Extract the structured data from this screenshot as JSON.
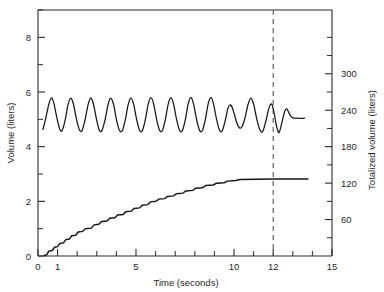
{
  "chart_data": {
    "type": "line",
    "title": "",
    "xlabel": "Time (seconds)",
    "ylabel": "Volume (liters)",
    "y2label": "Totalized volume (liters)",
    "xlim": [
      0,
      15
    ],
    "ylim": [
      0,
      9
    ],
    "y2lim": [
      0,
      405
    ],
    "grid": false,
    "legend": "none",
    "x_ticks_major": [
      0,
      1,
      5,
      10,
      12,
      15
    ],
    "x_tick_labels": [
      "0",
      "1",
      "5",
      "10",
      "12",
      "15"
    ],
    "x_ticks_minor": [
      2,
      3,
      4,
      6,
      7,
      8,
      9,
      11,
      13,
      14
    ],
    "y_ticks_major": [
      0,
      2,
      4,
      6,
      8
    ],
    "y_tick_labels": [
      "0",
      "2",
      "4",
      "6",
      "8"
    ],
    "y_ticks_minor": [
      1,
      3,
      5,
      7,
      9
    ],
    "y2_ticks_major": [
      60,
      120,
      180,
      240,
      300
    ],
    "y2_tick_labels": [
      "60",
      "120",
      "180",
      "240",
      "300"
    ],
    "y2_ticks_minor": [
      30,
      90,
      150,
      210,
      270,
      330,
      360
    ],
    "annotations": [
      {
        "name": "end-of-test-marker",
        "type": "vertical-dashed-line",
        "x": 12
      }
    ],
    "series": [
      {
        "name": "Breathing volume waveform",
        "axis": "left",
        "units": "liters",
        "points": [
          [
            0.25,
            4.62
          ],
          [
            0.4,
            5.05
          ],
          [
            0.55,
            5.55
          ],
          [
            0.68,
            5.78
          ],
          [
            0.8,
            5.62
          ],
          [
            0.95,
            5.1
          ],
          [
            1.1,
            4.66
          ],
          [
            1.22,
            4.58
          ],
          [
            1.38,
            4.95
          ],
          [
            1.52,
            5.5
          ],
          [
            1.66,
            5.77
          ],
          [
            1.8,
            5.58
          ],
          [
            1.95,
            5.05
          ],
          [
            2.1,
            4.64
          ],
          [
            2.24,
            4.58
          ],
          [
            2.4,
            4.98
          ],
          [
            2.55,
            5.52
          ],
          [
            2.68,
            5.78
          ],
          [
            2.82,
            5.58
          ],
          [
            2.98,
            5.02
          ],
          [
            3.12,
            4.62
          ],
          [
            3.26,
            4.58
          ],
          [
            3.42,
            4.98
          ],
          [
            3.57,
            5.53
          ],
          [
            3.7,
            5.78
          ],
          [
            3.85,
            5.56
          ],
          [
            4.0,
            5.0
          ],
          [
            4.15,
            4.6
          ],
          [
            4.3,
            4.58
          ],
          [
            4.46,
            5.0
          ],
          [
            4.6,
            5.54
          ],
          [
            4.74,
            5.78
          ],
          [
            4.88,
            5.55
          ],
          [
            5.03,
            5.0
          ],
          [
            5.18,
            4.6
          ],
          [
            5.32,
            4.58
          ],
          [
            5.48,
            5.0
          ],
          [
            5.62,
            5.55
          ],
          [
            5.76,
            5.79
          ],
          [
            5.9,
            5.56
          ],
          [
            6.05,
            5.0
          ],
          [
            6.2,
            4.6
          ],
          [
            6.34,
            4.58
          ],
          [
            6.5,
            5.0
          ],
          [
            6.64,
            5.55
          ],
          [
            6.78,
            5.79
          ],
          [
            6.92,
            5.55
          ],
          [
            7.07,
            5.0
          ],
          [
            7.22,
            4.6
          ],
          [
            7.36,
            4.58
          ],
          [
            7.52,
            5.0
          ],
          [
            7.66,
            5.56
          ],
          [
            7.8,
            5.8
          ],
          [
            7.94,
            5.55
          ],
          [
            8.09,
            5.0
          ],
          [
            8.24,
            4.6
          ],
          [
            8.38,
            4.58
          ],
          [
            8.54,
            5.0
          ],
          [
            8.68,
            5.56
          ],
          [
            8.82,
            5.8
          ],
          [
            8.96,
            5.55
          ],
          [
            9.11,
            5.0
          ],
          [
            9.26,
            4.6
          ],
          [
            9.4,
            4.58
          ],
          [
            9.56,
            4.98
          ],
          [
            9.7,
            5.42
          ],
          [
            9.84,
            5.52
          ],
          [
            9.98,
            5.28
          ],
          [
            10.12,
            4.92
          ],
          [
            10.26,
            4.7
          ],
          [
            10.4,
            4.72
          ],
          [
            10.56,
            5.05
          ],
          [
            10.72,
            5.55
          ],
          [
            10.86,
            5.78
          ],
          [
            11.0,
            5.56
          ],
          [
            11.16,
            5.02
          ],
          [
            11.32,
            4.62
          ],
          [
            11.46,
            4.55
          ],
          [
            11.62,
            4.92
          ],
          [
            11.78,
            5.4
          ],
          [
            11.92,
            5.56
          ],
          [
            12.05,
            5.22
          ],
          [
            12.18,
            4.72
          ],
          [
            12.3,
            4.52
          ],
          [
            12.45,
            4.9
          ],
          [
            12.58,
            5.28
          ],
          [
            12.7,
            5.38
          ],
          [
            12.84,
            5.18
          ],
          [
            12.98,
            5.06
          ],
          [
            13.2,
            5.04
          ],
          [
            13.6,
            5.04
          ]
        ]
      },
      {
        "name": "Totalized volume staircase",
        "axis": "left",
        "units": "liters",
        "points": [
          [
            0.3,
            0.02
          ],
          [
            0.45,
            0.05
          ],
          [
            0.55,
            0.18
          ],
          [
            0.72,
            0.2
          ],
          [
            0.85,
            0.32
          ],
          [
            1.0,
            0.34
          ],
          [
            1.12,
            0.46
          ],
          [
            1.3,
            0.48
          ],
          [
            1.42,
            0.6
          ],
          [
            1.6,
            0.62
          ],
          [
            1.72,
            0.74
          ],
          [
            1.92,
            0.76
          ],
          [
            2.05,
            0.88
          ],
          [
            2.28,
            0.9
          ],
          [
            2.42,
            1.0
          ],
          [
            2.72,
            1.02
          ],
          [
            2.86,
            1.14
          ],
          [
            3.1,
            1.16
          ],
          [
            3.24,
            1.26
          ],
          [
            3.52,
            1.28
          ],
          [
            3.66,
            1.38
          ],
          [
            3.92,
            1.4
          ],
          [
            4.06,
            1.5
          ],
          [
            4.34,
            1.52
          ],
          [
            4.48,
            1.62
          ],
          [
            4.76,
            1.64
          ],
          [
            4.9,
            1.74
          ],
          [
            5.18,
            1.76
          ],
          [
            5.32,
            1.86
          ],
          [
            5.6,
            1.88
          ],
          [
            5.74,
            1.98
          ],
          [
            6.02,
            2.0
          ],
          [
            6.16,
            2.08
          ],
          [
            6.46,
            2.1
          ],
          [
            6.6,
            2.18
          ],
          [
            6.92,
            2.2
          ],
          [
            7.06,
            2.28
          ],
          [
            7.4,
            2.3
          ],
          [
            7.54,
            2.38
          ],
          [
            7.9,
            2.4
          ],
          [
            8.04,
            2.48
          ],
          [
            8.4,
            2.5
          ],
          [
            8.56,
            2.58
          ],
          [
            8.94,
            2.6
          ],
          [
            9.1,
            2.66
          ],
          [
            9.5,
            2.68
          ],
          [
            9.66,
            2.74
          ],
          [
            10.1,
            2.76
          ],
          [
            10.3,
            2.8
          ],
          [
            12.0,
            2.82
          ],
          [
            13.8,
            2.82
          ]
        ]
      }
    ]
  }
}
